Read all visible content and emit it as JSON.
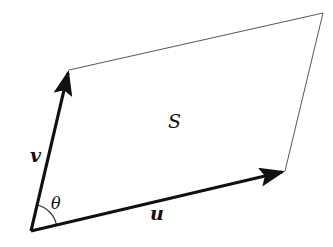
{
  "diagram": {
    "type": "parallelogram spanned by two vectors",
    "points": {
      "origin": [
        31,
        231
      ],
      "u_tip": [
        285,
        171
      ],
      "v_tip": [
        69,
        70
      ],
      "far_corner": [
        323,
        13
      ]
    },
    "labels": {
      "u": "u",
      "v": "v",
      "angle": "θ",
      "region": "S"
    },
    "colors": {
      "vector": "#111111",
      "edge": "#555555",
      "background": "#ffffff"
    }
  }
}
